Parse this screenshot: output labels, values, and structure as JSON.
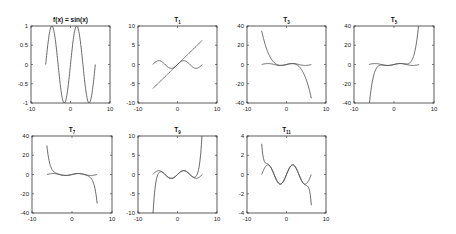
{
  "chart_data": [
    {
      "type": "line",
      "title": "f(x) = sin(x)",
      "title_main": "f(x) = sin(x)",
      "title_sub": "",
      "xlim": [
        -10,
        10
      ],
      "ylim": [
        -1,
        1
      ],
      "xticks": [
        "-10",
        "0",
        "10"
      ],
      "xtick_values": [
        -10,
        0,
        10
      ],
      "yticks": [
        "1",
        "0.5",
        "0",
        "-0.5",
        "-1"
      ],
      "ytick_values": [
        1,
        0.5,
        0,
        -0.5,
        -1
      ],
      "x_range": [
        -6.2832,
        6.2832
      ],
      "series": [
        {
          "name": "sin(x)",
          "function": "sin"
        }
      ]
    },
    {
      "type": "line",
      "title": "T1",
      "title_main": "T",
      "title_sub": "1",
      "xlim": [
        -10,
        10
      ],
      "ylim": [
        -10,
        10
      ],
      "xticks": [
        "-10",
        "0",
        "10"
      ],
      "xtick_values": [
        -10,
        0,
        10
      ],
      "yticks": [
        "10",
        "5",
        "0",
        "-5",
        "-10"
      ],
      "ytick_values": [
        10,
        5,
        0,
        -5,
        -10
      ],
      "x_range": [
        -6.2832,
        6.2832
      ],
      "series": [
        {
          "name": "sin(x)",
          "function": "sin"
        },
        {
          "name": "T1",
          "taylor_degree": 1
        }
      ]
    },
    {
      "type": "line",
      "title": "T3",
      "title_main": "T",
      "title_sub": "3",
      "xlim": [
        -10,
        10
      ],
      "ylim": [
        -40,
        40
      ],
      "xticks": [
        "-10",
        "0",
        "10"
      ],
      "xtick_values": [
        -10,
        0,
        10
      ],
      "yticks": [
        "40",
        "20",
        "0",
        "-20",
        "-40"
      ],
      "ytick_values": [
        40,
        20,
        0,
        -20,
        -40
      ],
      "x_range": [
        -6.2832,
        6.2832
      ],
      "series": [
        {
          "name": "sin(x)",
          "function": "sin"
        },
        {
          "name": "T3",
          "taylor_degree": 3
        }
      ]
    },
    {
      "type": "line",
      "title": "T5",
      "title_main": "T",
      "title_sub": "5",
      "xlim": [
        -10,
        10
      ],
      "ylim": [
        -40,
        40
      ],
      "xticks": [
        "-10",
        "0",
        "10"
      ],
      "xtick_values": [
        -10,
        0,
        10
      ],
      "yticks": [
        "40",
        "20",
        "0",
        "-20",
        "-40"
      ],
      "ytick_values": [
        40,
        20,
        0,
        -20,
        -40
      ],
      "x_range": [
        -6.2832,
        6.2832
      ],
      "series": [
        {
          "name": "sin(x)",
          "function": "sin"
        },
        {
          "name": "T5",
          "taylor_degree": 5
        }
      ]
    },
    {
      "type": "line",
      "title": "T7",
      "title_main": "T",
      "title_sub": "7",
      "xlim": [
        -10,
        10
      ],
      "ylim": [
        -40,
        40
      ],
      "xticks": [
        "-10",
        "0",
        "10"
      ],
      "xtick_values": [
        -10,
        0,
        10
      ],
      "yticks": [
        "40",
        "20",
        "0",
        "-20",
        "-40"
      ],
      "ytick_values": [
        40,
        20,
        0,
        -20,
        -40
      ],
      "x_range": [
        -6.2832,
        6.2832
      ],
      "series": [
        {
          "name": "sin(x)",
          "function": "sin"
        },
        {
          "name": "T7",
          "taylor_degree": 7
        }
      ]
    },
    {
      "type": "line",
      "title": "T9",
      "title_main": "T",
      "title_sub": "9",
      "xlim": [
        -10,
        10
      ],
      "ylim": [
        -10,
        10
      ],
      "xticks": [
        "-10",
        "0",
        "10"
      ],
      "xtick_values": [
        -10,
        0,
        10
      ],
      "yticks": [
        "10",
        "5",
        "0",
        "-5",
        "-10"
      ],
      "ytick_values": [
        10,
        5,
        0,
        -5,
        -10
      ],
      "x_range": [
        -6.2832,
        6.2832
      ],
      "series": [
        {
          "name": "sin(x)",
          "function": "sin"
        },
        {
          "name": "T9",
          "taylor_degree": 9
        }
      ]
    },
    {
      "type": "line",
      "title": "T11",
      "title_main": "T",
      "title_sub": "11",
      "xlim": [
        -10,
        10
      ],
      "ylim": [
        -4,
        4
      ],
      "xticks": [
        "-10",
        "0",
        "10"
      ],
      "xtick_values": [
        -10,
        0,
        10
      ],
      "yticks": [
        "4",
        "2",
        "0",
        "-2",
        "-4"
      ],
      "ytick_values": [
        4,
        2,
        0,
        -2,
        -4
      ],
      "x_range": [
        -6.2832,
        6.2832
      ],
      "series": [
        {
          "name": "sin(x)",
          "function": "sin"
        },
        {
          "name": "T11",
          "taylor_degree": 11
        }
      ]
    }
  ]
}
